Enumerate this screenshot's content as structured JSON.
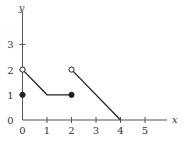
{
  "chart_data": {
    "type": "line",
    "title": "",
    "xlabel": "x",
    "ylabel": "y",
    "xlim": [
      0,
      5.9
    ],
    "ylim": [
      0,
      4.3
    ],
    "grid": false,
    "legend": null,
    "x_ticks": [
      0,
      1,
      2,
      3,
      4,
      5
    ],
    "x_tick_labels": [
      "0",
      "1",
      "2",
      "3",
      "4",
      "5"
    ],
    "y_ticks": [
      0,
      1,
      2,
      3
    ],
    "y_tick_labels": [
      "0",
      "1",
      "2",
      "3"
    ],
    "series": [
      {
        "name": "segment-1",
        "points": [
          [
            0,
            2
          ],
          [
            1,
            1
          ],
          [
            2,
            1
          ]
        ],
        "start_marker": "open",
        "end_marker": "closed"
      },
      {
        "name": "segment-2",
        "points": [
          [
            2,
            2
          ],
          [
            4,
            0
          ]
        ],
        "start_marker": "open",
        "end_marker": "none"
      }
    ],
    "isolated_points": [
      {
        "x": 0,
        "y": 1,
        "marker": "closed"
      }
    ]
  },
  "colors": {
    "axis": "#555555",
    "line": "#222222",
    "text": "#333333"
  }
}
